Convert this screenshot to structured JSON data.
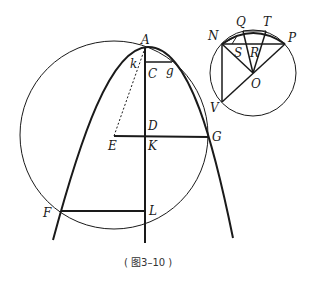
{
  "figure": {
    "caption": "( 图3–10 )",
    "main_labels": {
      "A": "A",
      "k": "k",
      "C": "C",
      "g": "g",
      "D": "D",
      "E": "E",
      "K": "K",
      "G": "G",
      "F": "F",
      "L": "L"
    },
    "inset_labels": {
      "Q": "Q",
      "T": "T",
      "N": "N",
      "P": "P",
      "S": "S",
      "R": "R",
      "O": "O",
      "V": "V"
    },
    "colors": {
      "stroke": "#1a1a1a",
      "background": "#ffffff"
    }
  }
}
